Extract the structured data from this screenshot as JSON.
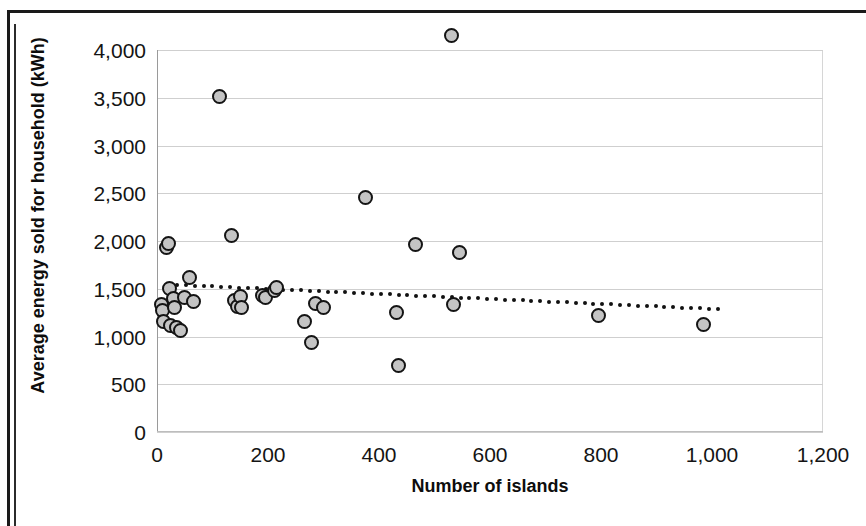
{
  "chart_data": {
    "type": "scatter",
    "title": "",
    "xlabel": "Number of islands",
    "ylabel": "Average energy sold for household (kWh)",
    "xlim": [
      0,
      1200
    ],
    "ylim": [
      0,
      4000
    ],
    "xticks": [
      "0",
      "200",
      "400",
      "600",
      "800",
      "1,000",
      "1,200"
    ],
    "xtick_values": [
      0,
      200,
      400,
      600,
      800,
      1000,
      1200
    ],
    "yticks": [
      "0",
      "500",
      "1,000",
      "1,500",
      "2,000",
      "2,500",
      "3,000",
      "3,500",
      "4,000"
    ],
    "ytick_values": [
      0,
      500,
      1000,
      1500,
      2000,
      2500,
      3000,
      3500,
      4000
    ],
    "grid": true,
    "legend": false,
    "marker": {
      "shape": "circle",
      "fill_color": "#c4c4c4",
      "edge_color": "#141414",
      "size_px": 15
    },
    "series": [
      {
        "name": "Average energy sold for household",
        "points": [
          [
            8,
            1330
          ],
          [
            10,
            1270
          ],
          [
            12,
            1160
          ],
          [
            18,
            1930
          ],
          [
            20,
            1970
          ],
          [
            22,
            1500
          ],
          [
            24,
            1120
          ],
          [
            30,
            1400
          ],
          [
            32,
            1300
          ],
          [
            36,
            1090
          ],
          [
            42,
            1060
          ],
          [
            50,
            1410
          ],
          [
            58,
            1620
          ],
          [
            66,
            1370
          ],
          [
            112,
            3510
          ],
          [
            134,
            2060
          ],
          [
            140,
            1380
          ],
          [
            145,
            1310
          ],
          [
            150,
            1420
          ],
          [
            152,
            1300
          ],
          [
            190,
            1430
          ],
          [
            196,
            1410
          ],
          [
            212,
            1480
          ],
          [
            216,
            1510
          ],
          [
            265,
            1160
          ],
          [
            278,
            940
          ],
          [
            285,
            1350
          ],
          [
            300,
            1300
          ],
          [
            376,
            2460
          ],
          [
            432,
            1250
          ],
          [
            436,
            700
          ],
          [
            466,
            1960
          ],
          [
            530,
            4150
          ],
          [
            534,
            1330
          ],
          [
            545,
            1880
          ],
          [
            795,
            1220
          ],
          [
            985,
            1130
          ]
        ]
      }
    ],
    "trendline": {
      "style": "dotted",
      "color": "#111111",
      "x_start": 20,
      "x_end": 1010,
      "y_start": 1545,
      "y_end": 1285
    }
  }
}
